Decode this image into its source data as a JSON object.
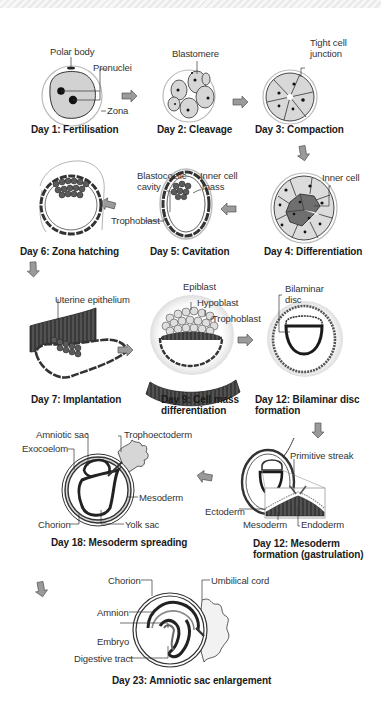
{
  "colors": {
    "outline": "#333333",
    "cell_fill": "#d6d6d6",
    "dark_cell": "#6f6f6f",
    "zona": "#bdbdbd",
    "arrow": "#8a8a8a",
    "caption": "#1a1a1a"
  },
  "stages": [
    {
      "id": "day1",
      "caption": "Day 1: Fertilisation",
      "labels": [
        "Polar body",
        "Pronuclei",
        "Zona"
      ]
    },
    {
      "id": "day2",
      "caption": "Day 2: Cleavage",
      "labels": [
        "Blastomere"
      ]
    },
    {
      "id": "day3",
      "caption": "Day 3: Compaction",
      "labels": [
        "Tight cell",
        "junction"
      ]
    },
    {
      "id": "day4",
      "caption": "Day 4: Differentiation",
      "labels": [
        "Inner cell"
      ]
    },
    {
      "id": "day5",
      "caption": "Day 5: Cavitation",
      "labels": [
        "Blastocoelic",
        "cavity",
        "Inner cell",
        "mass",
        "Trophoblast"
      ]
    },
    {
      "id": "day6",
      "caption": "Day 6: Zona hatching",
      "labels": []
    },
    {
      "id": "day7",
      "caption": "Day 7: Implantation",
      "labels": [
        "Uterine epithelium"
      ]
    },
    {
      "id": "day9",
      "caption_line1": "Day 9: Cell mass",
      "caption_line2": "differentiation",
      "labels": [
        "Epiblast",
        "Hypoblast",
        "Trophoblast"
      ]
    },
    {
      "id": "day12a",
      "caption_line1": "Day 12: Bilaminar disc",
      "caption_line2": "formation",
      "labels": [
        "Bilaminar",
        "disc"
      ]
    },
    {
      "id": "day12b",
      "caption_line1": "Day 12: Mesoderm",
      "caption_line2": "formation (gastrulation)",
      "labels": [
        "Primitive streak",
        "Ectoderm",
        "Mesoderm",
        "Endoderm"
      ]
    },
    {
      "id": "day18",
      "caption": "Day 18: Mesoderm spreading",
      "labels": [
        "Amniotic sac",
        "Trophoectoderm",
        "Exocoelom",
        "Mesoderm",
        "Chorion",
        "Yolk sac"
      ]
    },
    {
      "id": "day23",
      "caption": "Day 23: Amniotic sac enlargement",
      "labels": [
        "Chorion",
        "Umbilical cord",
        "Amnion",
        "Embryo",
        "Digestive tract"
      ]
    }
  ],
  "flow_order": [
    "day1",
    "day2",
    "day3",
    "day4",
    "day5",
    "day6",
    "day7",
    "day9",
    "day12a",
    "day12b",
    "day18",
    "day23"
  ]
}
